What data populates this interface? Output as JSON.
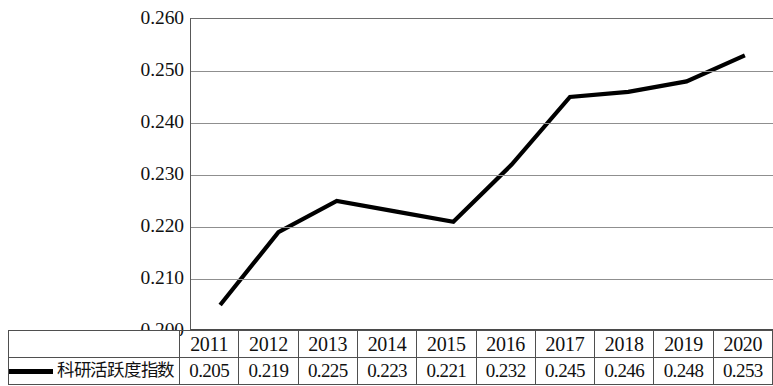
{
  "chart_data": {
    "type": "line",
    "title": "",
    "xlabel": "",
    "ylabel": "",
    "categories": [
      "2011",
      "2012",
      "2013",
      "2014",
      "2015",
      "2016",
      "2017",
      "2018",
      "2019",
      "2020"
    ],
    "series": [
      {
        "name": "科研活跃度指数",
        "values": [
          0.205,
          0.219,
          0.225,
          0.223,
          0.221,
          0.232,
          0.245,
          0.246,
          0.248,
          0.253
        ]
      }
    ],
    "value_labels": [
      "0.205",
      "0.219",
      "0.225",
      "0.223",
      "0.221",
      "0.232",
      "0.245",
      "0.246",
      "0.248",
      "0.253"
    ],
    "ylim": [
      0.2,
      0.26
    ],
    "ytick_labels": [
      "0.260",
      "0.250",
      "0.240",
      "0.230",
      "0.220",
      "0.210",
      "0.200"
    ],
    "ytick_values": [
      0.26,
      0.25,
      0.24,
      0.23,
      0.22,
      0.21,
      0.2
    ],
    "grid": true,
    "legend_position": "bottom-left",
    "line_color": "#000000",
    "grid_color": "#8f8f8f",
    "axis_color": "#4a4a4a",
    "markers": false
  },
  "legend": {
    "label": "科研活跃度指数",
    "swatch": "line-swatch"
  },
  "table": {
    "year_header": [
      "2011",
      "2012",
      "2013",
      "2014",
      "2015",
      "2016",
      "2017",
      "2018",
      "2019",
      "2020"
    ],
    "value_row": [
      "0.205",
      "0.219",
      "0.225",
      "0.223",
      "0.221",
      "0.232",
      "0.245",
      "0.246",
      "0.248",
      "0.253"
    ]
  }
}
